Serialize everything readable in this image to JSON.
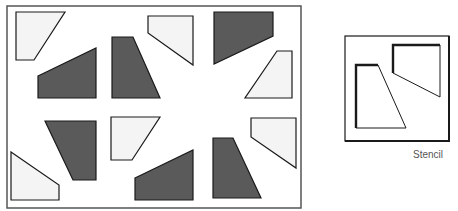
{
  "diagram": {
    "colors": {
      "dark_fill": "#5a5a5a",
      "light_fill": "#f4f4f4",
      "stroke": "#1a1a1a",
      "frame_stroke": "#555555",
      "background": "#ffffff"
    },
    "board": {
      "frame": {
        "x": 7,
        "y": 6,
        "width": 294,
        "height": 202
      },
      "shapes": [
        {
          "id": "s1",
          "tone": "light",
          "points": "16,12 65,12 34,60 16,60"
        },
        {
          "id": "s2",
          "tone": "dark",
          "points": "38,76 96,48 96,98 38,98"
        },
        {
          "id": "s3",
          "tone": "dark",
          "points": "112,37 133,37 160,98 112,98"
        },
        {
          "id": "s4",
          "tone": "light",
          "points": "148,16 193,16 193,65 148,33"
        },
        {
          "id": "s5",
          "tone": "dark",
          "points": "214,12 273,12 273,36 214,64"
        },
        {
          "id": "s6",
          "tone": "light",
          "points": "277,51 292,51 292,98 245,98"
        },
        {
          "id": "s7",
          "tone": "light",
          "points": "11,152 59,185 59,200 11,200"
        },
        {
          "id": "s8",
          "tone": "dark",
          "points": "45,121 96,121 96,180 73,180"
        },
        {
          "id": "s9",
          "tone": "light",
          "points": "111,117 160,117 132,160 111,160"
        },
        {
          "id": "s10",
          "tone": "dark",
          "points": "135,178 193,150 193,200 135,200"
        },
        {
          "id": "s11",
          "tone": "dark",
          "points": "213,138 233,138 261,198 213,198"
        },
        {
          "id": "s12",
          "tone": "light",
          "points": "251,118 296,118 296,168 251,137"
        }
      ]
    },
    "stencil": {
      "frame": {
        "x": 345,
        "y": 36,
        "width": 104,
        "height": 105
      },
      "cutouts": [
        {
          "id": "c1",
          "points": "356,65 378,65 406,128 356,128"
        },
        {
          "id": "c2",
          "points": "393,45 440,45 440,97 393,73"
        }
      ],
      "label": "Stencil"
    }
  }
}
